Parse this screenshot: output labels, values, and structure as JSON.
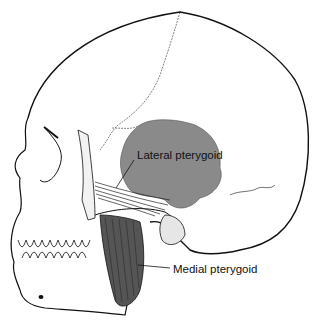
{
  "figure": {
    "labels": {
      "lateral": "Lateral pterygoid",
      "medial": "Medial pterygoid"
    },
    "colors": {
      "background": "#ffffff",
      "outline": "#111111",
      "lateral_pterygoid_fill": "#8a8a8a",
      "medial_pterygoid_fill": "#555555",
      "stipple": "#444444"
    }
  }
}
